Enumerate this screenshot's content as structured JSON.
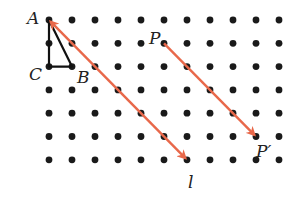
{
  "diagram": {
    "type": "dot-grid translation",
    "grid": {
      "columns": 11,
      "rows": 7,
      "origin_x": 49,
      "origin_y": 20,
      "spacing_x": 23,
      "spacing_y": 23.3,
      "dot_radius": 3.4,
      "dot_color": "#1a1a1a"
    },
    "triangle": {
      "vertices": [
        {
          "name": "A",
          "col": 0,
          "row": 0
        },
        {
          "name": "C",
          "col": 0,
          "row": 2
        },
        {
          "name": "B",
          "col": 1,
          "row": 2
        }
      ],
      "stroke": "#111111"
    },
    "vectors": [
      {
        "name": "l",
        "from": {
          "col": 0,
          "row": 0
        },
        "to": {
          "col": 6,
          "row": 6
        },
        "arrow_at": "both",
        "label": "l"
      },
      {
        "name": "PP'",
        "from": {
          "col": 5,
          "row": 1
        },
        "to": {
          "col": 9,
          "row": 5
        },
        "arrow_at": "end"
      }
    ],
    "arrow_color": "#e8684a",
    "labels": {
      "A": "A",
      "B": "B",
      "C": "C",
      "P": "P",
      "P_prime": "P′",
      "l": "l"
    }
  }
}
